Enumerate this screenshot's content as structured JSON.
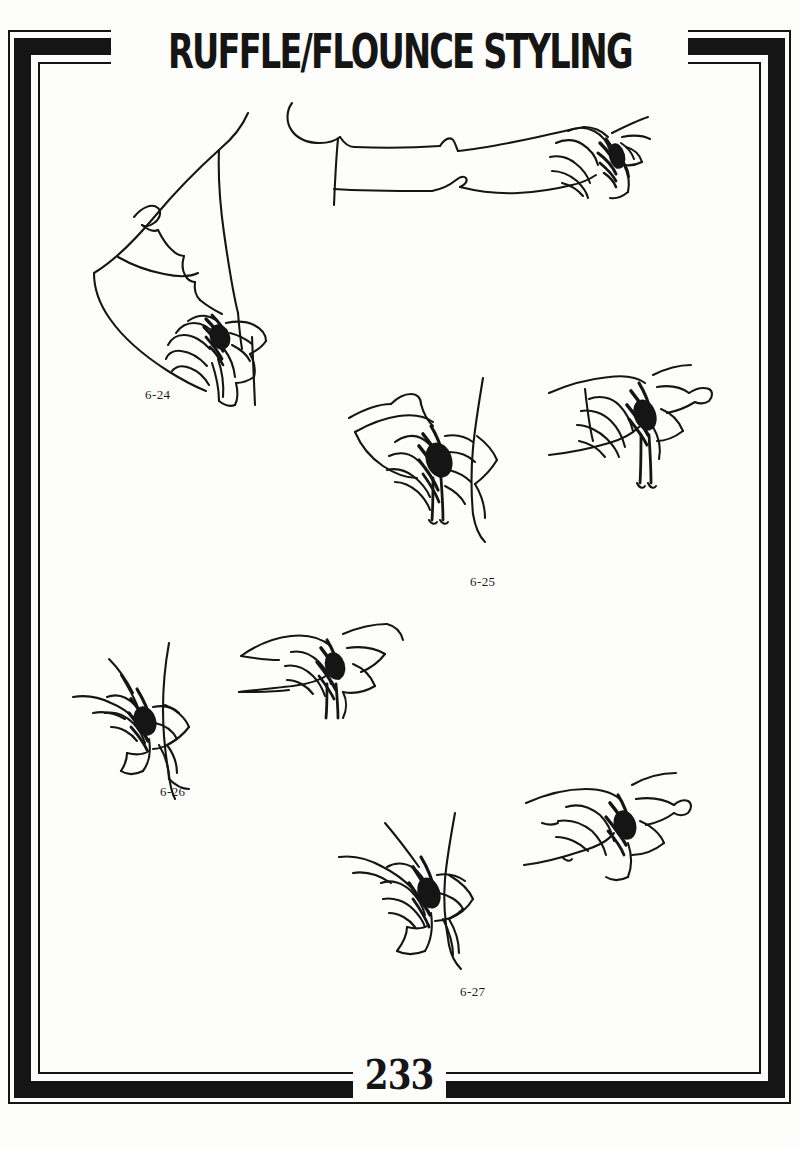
{
  "page": {
    "title": "RUFFLE/FLOUNCE STYLING",
    "page_number": "233",
    "background_color": "#fdfdfc",
    "ink_color": "#151515"
  },
  "border": {
    "style": "art-deco-double-rule",
    "outer_rule_color": "#151515",
    "thick_band_color": "#151515",
    "inner_rule_color": "#151515"
  },
  "figures": [
    {
      "id": "fig-6-24",
      "caption": "6-24",
      "description": "Bent arm, elbow-length sleeve with gathered ruffle flounce at the elbow"
    },
    {
      "id": "fig-top-right",
      "caption": "",
      "description": "Extended straight arm with ruffle flounce cuff at the wrist"
    },
    {
      "id": "fig-6-25",
      "caption": "6-25",
      "description": "Shoulder with dense gathered flounce and streamer ties"
    },
    {
      "id": "fig-upper-right",
      "caption": "",
      "description": "Sleeve cuff with radiating gathered ruffle and hanging ties"
    },
    {
      "id": "fig-6-26",
      "caption": "6-26",
      "description": "Shoulder/armhole with drooping petal flounce"
    },
    {
      "id": "fig-mid-center",
      "caption": "",
      "description": "Horizontal cuff band with gathered flounce spray"
    },
    {
      "id": "fig-6-27",
      "caption": "6-27",
      "description": "Hip/waist with gathered ruffle flounce and soft drape"
    },
    {
      "id": "fig-lower-right",
      "caption": "",
      "description": "Wrist cuff with flared gathered ruffle"
    }
  ]
}
